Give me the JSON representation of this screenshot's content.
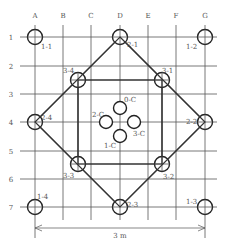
{
  "diagram": {
    "columns": [
      {
        "label": "A",
        "x": 35
      },
      {
        "label": "B",
        "x": 63
      },
      {
        "label": "C",
        "x": 91
      },
      {
        "label": "D",
        "x": 120
      },
      {
        "label": "E",
        "x": 148
      },
      {
        "label": "F",
        "x": 176
      },
      {
        "label": "G",
        "x": 205
      }
    ],
    "rows": [
      {
        "label": "1",
        "y": 37
      },
      {
        "label": "2",
        "y": 66
      },
      {
        "label": "3",
        "y": 94
      },
      {
        "label": "4",
        "y": 122
      },
      {
        "label": "5",
        "y": 151
      },
      {
        "label": "6",
        "y": 179
      },
      {
        "label": "7",
        "y": 207
      }
    ],
    "nodes": [
      {
        "id": "1-1",
        "x": 35,
        "y": 37,
        "label": "1-1",
        "lx": 41,
        "ly": 49
      },
      {
        "id": "1-2",
        "x": 205,
        "y": 37,
        "label": "1-2",
        "lx": 186,
        "ly": 49
      },
      {
        "id": "1-3",
        "x": 205,
        "y": 207,
        "label": "1-3",
        "lx": 186,
        "ly": 204
      },
      {
        "id": "1-4",
        "x": 35,
        "y": 207,
        "label": "1-4",
        "lx": 37,
        "ly": 199
      },
      {
        "id": "2-1",
        "x": 120,
        "y": 37,
        "label": "2-1",
        "lx": 127,
        "ly": 47
      },
      {
        "id": "2-2",
        "x": 205,
        "y": 122,
        "label": "2-2",
        "lx": 186,
        "ly": 124
      },
      {
        "id": "2-3",
        "x": 120,
        "y": 207,
        "label": "2-3",
        "lx": 127,
        "ly": 207
      },
      {
        "id": "2-4",
        "x": 35,
        "y": 122,
        "label": "2-4",
        "lx": 41,
        "ly": 120
      },
      {
        "id": "3-1",
        "x": 162,
        "y": 80,
        "label": "3-1",
        "lx": 162,
        "ly": 73
      },
      {
        "id": "3-2",
        "x": 162,
        "y": 164,
        "label": "3-2",
        "lx": 163,
        "ly": 179
      },
      {
        "id": "3-3",
        "x": 78,
        "y": 164,
        "label": "3-3",
        "lx": 63,
        "ly": 178
      },
      {
        "id": "3-4",
        "x": 78,
        "y": 80,
        "label": "3-4",
        "lx": 63,
        "ly": 73
      }
    ],
    "center_nodes": [
      {
        "id": "0-C",
        "x": 120,
        "y": 108,
        "label": "0-C",
        "lx": 124,
        "ly": 102
      },
      {
        "id": "2-C",
        "x": 106,
        "y": 122,
        "label": "2-C",
        "lx": 92,
        "ly": 117
      },
      {
        "id": "3-C",
        "x": 134,
        "y": 122,
        "label": "3-C",
        "lx": 133,
        "ly": 136
      },
      {
        "id": "1-C",
        "x": 120,
        "y": 136,
        "label": "1-C",
        "lx": 104,
        "ly": 148
      }
    ],
    "dimension": {
      "label": "3 m",
      "x1": 35,
      "x2": 205,
      "y": 228
    }
  }
}
